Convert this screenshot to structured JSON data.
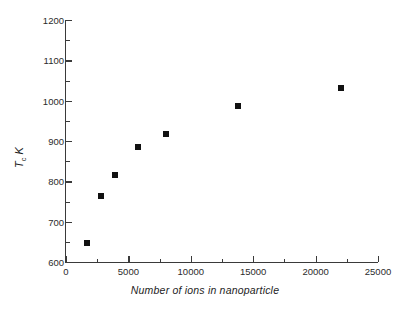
{
  "chart_data": {
    "type": "scatter",
    "title": "",
    "xlabel": "Number of ions in nanoparticle",
    "ylabel": "Tc K",
    "ylabel_parts": {
      "symbol": "T",
      "subscript": "c",
      "unit": "K"
    },
    "xlim": [
      0,
      25000
    ],
    "ylim": [
      600,
      1200
    ],
    "x_ticks": [
      0,
      5000,
      10000,
      15000,
      20000,
      25000
    ],
    "x_tick_labels": [
      "0",
      "5000",
      "10000",
      "15000",
      "20000",
      "25000"
    ],
    "x_minor_step": 2500,
    "y_ticks": [
      600,
      700,
      800,
      900,
      1000,
      1100,
      1200
    ],
    "y_tick_labels": [
      "600",
      "700",
      "800",
      "900",
      "1000",
      "1100",
      "1200"
    ],
    "y_minor_step": 50,
    "grid": false,
    "legend": null,
    "marker": {
      "shape": "square",
      "color": "#111111",
      "size_px": 6
    },
    "series": [
      {
        "name": "Tc vs number of ions",
        "x": [
          1700,
          2800,
          3900,
          5800,
          8000,
          13800,
          22000
        ],
        "y": [
          647,
          763,
          815,
          886,
          918,
          988,
          1032
        ]
      }
    ]
  },
  "axes": {
    "x_title": "Number of ions in nanoparticle",
    "y_title_symbol": "T",
    "y_title_subscript": "c",
    "y_title_unit": "K"
  }
}
